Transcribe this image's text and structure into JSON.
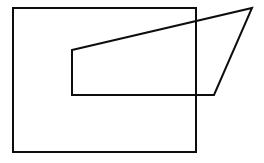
{
  "canvas": {
    "width": 264,
    "height": 163,
    "background_color": "#ffffff",
    "stroke_color": "#0d0d0d",
    "stroke_width": 2
  },
  "figure": {
    "shape_count": 2
  },
  "chart_data": {
    "type": "line",
    "xlabel": "",
    "ylabel": "",
    "xlim": [
      0,
      264
    ],
    "ylim": [
      163,
      0
    ],
    "grid": false,
    "legend": "none",
    "series": [
      {
        "name": "large-rectangle",
        "shape": "rectangle",
        "closed": true,
        "points": [
          [
            13,
            8
          ],
          [
            196,
            8
          ],
          [
            196,
            152
          ],
          [
            13,
            152
          ]
        ]
      },
      {
        "name": "slanted-trapezoid",
        "shape": "trapezoid",
        "closed": true,
        "points": [
          [
            72,
            50
          ],
          [
            252,
            8
          ],
          [
            214,
            95
          ],
          [
            72,
            95
          ]
        ]
      }
    ],
    "annotations": [
      {
        "name": "inner-rectangle-overlap",
        "note": "Region bounded by x 72-196, y 50-95 where both quadrilaterals overlap",
        "points": [
          [
            72,
            50
          ],
          [
            196,
            50
          ],
          [
            196,
            95
          ],
          [
            72,
            95
          ]
        ]
      },
      {
        "name": "diagonal-edge",
        "note": "Slanted right edge of the trapezoid",
        "from": [
          252,
          8
        ],
        "to": [
          214,
          95
        ]
      },
      {
        "name": "crossing-point",
        "note": "Right edge of large rectangle crosses bottom edge of trapezoid",
        "at": [
          196,
          95
        ]
      }
    ]
  }
}
